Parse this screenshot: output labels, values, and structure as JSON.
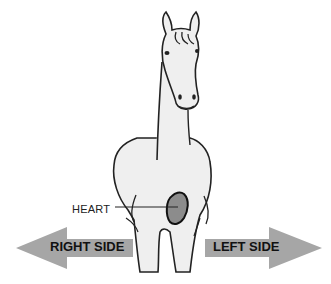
{
  "diagram": {
    "labels": {
      "heart": "HEART",
      "right_side": "RIGHT SIDE",
      "left_side": "LEFT SIDE"
    },
    "colors": {
      "horse_fill": "#efefef",
      "outline": "#222222",
      "heart_fill": "#8c8c8c",
      "arrow_fill": "#a6a6a6",
      "background": "#ffffff"
    },
    "arrows": [
      {
        "direction": "left",
        "label_key": "right_side"
      },
      {
        "direction": "right",
        "label_key": "left_side"
      }
    ]
  }
}
